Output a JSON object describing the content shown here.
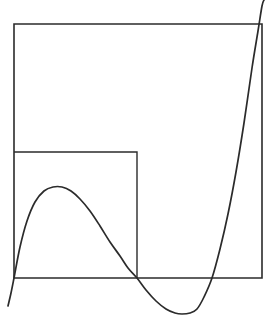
{
  "figure": {
    "width": 270,
    "height": 323,
    "background_color": "#ffffff",
    "stroke_color": "#2b2b2b",
    "curve_color": "#2b2b2b",
    "outer_rect_stroke_width": 1.6,
    "inner_rect_stroke_width": 1.4,
    "curve_stroke_width": 1.7
  },
  "outer_rectangle": {
    "name": "outer-rectangle",
    "x": 14,
    "y": 24,
    "width": 248,
    "height": 254,
    "left": 14,
    "top": 24,
    "right": 262,
    "bottom": 278
  },
  "inner_rectangle": {
    "name": "inner-rectangle",
    "x": 14,
    "y": 152,
    "width": 123,
    "height": 126,
    "left": 14,
    "top": 152,
    "right": 137,
    "bottom": 278
  },
  "baseline": {
    "name": "baseline",
    "y": 278,
    "x_start": 14,
    "x_end": 262
  },
  "chart_data": {
    "type": "line",
    "subtitle": "",
    "xlabel": "",
    "ylabel": "",
    "grid": false,
    "legend": false,
    "axis_ranges": {
      "xlim": [
        8,
        266
      ],
      "ylim": [
        323,
        0
      ]
    },
    "series": [
      {
        "name": "cubic-curve",
        "color": "#2b2b2b",
        "roots_px_x": [
          14,
          137,
          212
        ],
        "local_maximum_px": [
          62,
          187
        ],
        "local_minimum_px": [
          182,
          314
        ],
        "start_point_px": [
          8,
          306
        ],
        "end_point_px": [
          264,
          0
        ],
        "points_px": [
          [
            8,
            306
          ],
          [
            11,
            293
          ],
          [
            14,
            278
          ],
          [
            20,
            247
          ],
          [
            27,
            221
          ],
          [
            35,
            202
          ],
          [
            44,
            191
          ],
          [
            53,
            187
          ],
          [
            62,
            187
          ],
          [
            71,
            191
          ],
          [
            80,
            199
          ],
          [
            90,
            211
          ],
          [
            100,
            226
          ],
          [
            110,
            242
          ],
          [
            120,
            256
          ],
          [
            128,
            268
          ],
          [
            137,
            278
          ],
          [
            146,
            290
          ],
          [
            156,
            301
          ],
          [
            166,
            309
          ],
          [
            175,
            313
          ],
          [
            182,
            314
          ],
          [
            190,
            313
          ],
          [
            197,
            309
          ],
          [
            204,
            297
          ],
          [
            212,
            278
          ],
          [
            220,
            249
          ],
          [
            228,
            214
          ],
          [
            236,
            172
          ],
          [
            244,
            123
          ],
          [
            252,
            68
          ],
          [
            258,
            31
          ],
          [
            262,
            6
          ],
          [
            264,
            0
          ]
        ]
      }
    ],
    "annotations": [
      {
        "name": "outer-rectangle",
        "shape": "rect",
        "x": 14,
        "y": 24,
        "width": 248,
        "height": 254
      },
      {
        "name": "inner-rectangle",
        "shape": "rect",
        "x": 14,
        "y": 152,
        "width": 123,
        "height": 126
      }
    ]
  }
}
